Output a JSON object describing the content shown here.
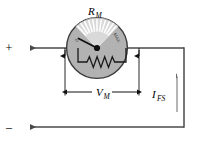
{
  "figure": {
    "kind": "circuit-diagram",
    "title_label": "R",
    "title_sub": "M",
    "background_color": "#ffffff",
    "wire_color": "#4a4a4a",
    "ink_color": "#000000"
  },
  "labels": {
    "meter_resistance": {
      "main": "R",
      "sub": "M",
      "name": "meter-resistance"
    },
    "meter_voltage": {
      "main": "V",
      "sub": "M",
      "name": "meter-voltage"
    },
    "full_scale_current": {
      "main": "I",
      "sub": "FS",
      "name": "full-scale-current"
    },
    "terminal_positive": "+",
    "terminal_negative": "–"
  },
  "meter": {
    "face_min_label": "0",
    "face_max_label": "MAX",
    "tick_count": 13,
    "body_color": "#b2b2b2",
    "body_stroke": "#3c3c3c",
    "face_color": "#d9d9d9",
    "tick_color": "#ffffff",
    "needle_color": "#111111",
    "resistor_color": "#1a1a1a",
    "center_x": 97,
    "center_y": 48,
    "radius": 31
  },
  "dimensions": {
    "v_m": {
      "label_main": "V",
      "label_sub": "M",
      "x_left": 65,
      "x_right": 139,
      "y": 92
    },
    "i_fs": {
      "label_main": "I",
      "label_sub": "FS",
      "x": 177,
      "y_top": 74,
      "y_bottom": 112
    }
  },
  "wires": {
    "top_y": 48,
    "bottom_y": 127,
    "left_x": 14,
    "right_x": 184,
    "arrow_top_x": 34,
    "arrow_bottom_x": 34
  }
}
